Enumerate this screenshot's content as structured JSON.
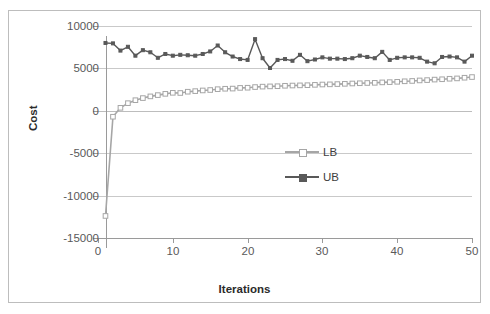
{
  "chart_data": {
    "type": "line",
    "title": "",
    "xlabel": "Iterations",
    "ylabel": "Cost",
    "xlim": [
      0,
      50
    ],
    "ylim": [
      -15000,
      10000
    ],
    "xticks": [
      0,
      10,
      20,
      30,
      40,
      50
    ],
    "yticks": [
      10000,
      5000,
      0,
      -5000,
      -10000,
      -15000
    ],
    "ytick_labels": [
      "10000",
      "5000",
      "0",
      "-5000",
      "-10000",
      "-15000"
    ],
    "xtick_labels": [
      "0",
      "10",
      "20",
      "30",
      "40",
      "50"
    ],
    "grid": true,
    "legend_position": "center",
    "x": [
      1,
      2,
      3,
      4,
      5,
      6,
      7,
      8,
      9,
      10,
      11,
      12,
      13,
      14,
      15,
      16,
      17,
      18,
      19,
      20,
      21,
      22,
      23,
      24,
      25,
      26,
      27,
      28,
      29,
      30,
      31,
      32,
      33,
      34,
      35,
      36,
      37,
      38,
      39,
      40,
      41,
      42,
      43,
      44,
      45,
      46,
      47,
      48,
      49,
      50
    ],
    "series": [
      {
        "name": "LB",
        "color": "#a6a6a6",
        "marker": "square",
        "values": [
          -12400,
          -700,
          350,
          900,
          1250,
          1500,
          1700,
          1850,
          2000,
          2120,
          2100,
          2250,
          2320,
          2400,
          2450,
          2550,
          2600,
          2620,
          2700,
          2720,
          2800,
          2850,
          2880,
          2900,
          2950,
          2980,
          3000,
          3020,
          3060,
          3100,
          3120,
          3150,
          3180,
          3220,
          3250,
          3280,
          3300,
          3350,
          3380,
          3420,
          3480,
          3520,
          3580,
          3620,
          3680,
          3720,
          3780,
          3820,
          3900,
          3980
        ]
      },
      {
        "name": "UB",
        "color": "#595959",
        "marker": "small-square",
        "values": [
          8000,
          7950,
          7100,
          7550,
          6500,
          7150,
          6900,
          6250,
          6700,
          6500,
          6600,
          6550,
          6500,
          6700,
          7000,
          7700,
          6900,
          6400,
          6100,
          6000,
          8450,
          6200,
          5050,
          6000,
          6100,
          5900,
          6600,
          5850,
          6050,
          6300,
          6150,
          6150,
          6100,
          6200,
          6500,
          6350,
          6200,
          6950,
          6000,
          6250,
          6300,
          6300,
          6250,
          5800,
          5600,
          6350,
          6400,
          6300,
          5800,
          6500
        ]
      }
    ]
  },
  "legend": {
    "items": [
      {
        "label": "LB"
      },
      {
        "label": "UB"
      }
    ]
  },
  "colors": {
    "lb": "#a6a6a6",
    "ub": "#595959",
    "grid": "#c9c9c9",
    "axis": "#9a9a9a",
    "tick_text": "#595959",
    "title_text": "#2b2b2b",
    "frame": "#bdbdbd",
    "background": "#ffffff"
  }
}
